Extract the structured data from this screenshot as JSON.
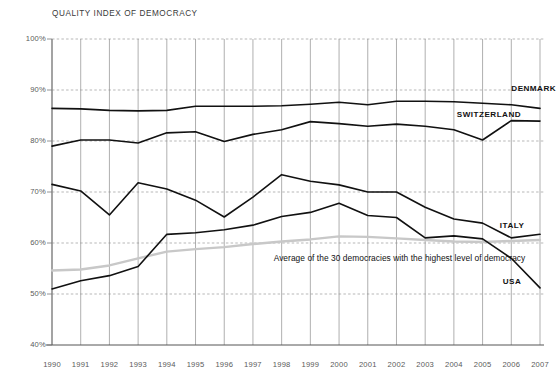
{
  "chart_data": {
    "type": "line",
    "title": "QUALITY INDEX OF DEMOCRACY",
    "xlabel": "",
    "ylabel": "",
    "ylim": [
      40,
      100
    ],
    "xlim": [
      1990,
      2007
    ],
    "grid": true,
    "legend_position": "inline-right",
    "ytick_labels": [
      "100%",
      "90%",
      "80%",
      "70%",
      "60%",
      "50%",
      "40%"
    ],
    "ytick_values": [
      100,
      90,
      80,
      70,
      60,
      50,
      40
    ],
    "x": [
      1990,
      1991,
      1992,
      1993,
      1994,
      1995,
      1996,
      1997,
      1998,
      1999,
      2000,
      2001,
      2002,
      2003,
      2004,
      2005,
      2006,
      2007
    ],
    "xtick_labels": [
      "1990",
      "1991",
      "1992",
      "1993",
      "1994",
      "1995",
      "1996",
      "1997",
      "1998",
      "1999",
      "2000",
      "2001",
      "2002",
      "2003",
      "2004",
      "2005",
      "2006",
      "2007"
    ],
    "series": [
      {
        "name": "DENMARK",
        "color": "#111111",
        "width": 1.6,
        "label_x": 2006.0,
        "label_y": 90.2,
        "values": [
          86.4,
          86.3,
          86.0,
          85.9,
          86.0,
          86.8,
          86.8,
          86.8,
          86.9,
          87.2,
          87.6,
          87.1,
          87.8,
          87.8,
          87.7,
          87.4,
          87.1,
          86.4
        ]
      },
      {
        "name": "SWITZERLAND",
        "color": "#111111",
        "width": 1.6,
        "label_x": 2004.1,
        "label_y": 85.1,
        "values": [
          79.0,
          80.2,
          80.2,
          79.6,
          81.6,
          81.8,
          79.9,
          81.3,
          82.2,
          83.8,
          83.4,
          82.9,
          83.3,
          82.9,
          82.2,
          80.2,
          84.0,
          83.9
        ]
      },
      {
        "name": "ITALY",
        "color": "#111111",
        "width": 1.6,
        "label_x": 2005.6,
        "label_y": 63.4,
        "values": [
          71.5,
          70.2,
          65.5,
          71.8,
          70.6,
          68.4,
          65.1,
          69.0,
          73.4,
          72.1,
          71.4,
          70.0,
          70.0,
          67.0,
          64.7,
          63.9,
          61.0,
          61.7
        ]
      },
      {
        "name": "USA",
        "color": "#111111",
        "width": 1.6,
        "label_x": 2005.7,
        "label_y": 52.3,
        "values": [
          51.0,
          52.6,
          53.6,
          55.4,
          61.7,
          62.0,
          62.6,
          63.5,
          65.2,
          66.0,
          67.8,
          65.4,
          65.0,
          61.0,
          61.4,
          60.8,
          57.0,
          51.2
        ]
      },
      {
        "name": "Average of the 30 democracies with the highest level of democracy",
        "color": "#c8c8c8",
        "width": 2.4,
        "values": [
          54.6,
          54.8,
          55.6,
          57.0,
          58.3,
          58.8,
          59.2,
          59.8,
          60.3,
          60.7,
          61.3,
          61.2,
          60.9,
          60.6,
          60.3,
          60.2,
          60.4,
          60.6
        ]
      }
    ],
    "annotation": {
      "text": "Average of the 30 democracies with the highest level of democracy",
      "x": 1998.0,
      "y": 56.8
    }
  }
}
